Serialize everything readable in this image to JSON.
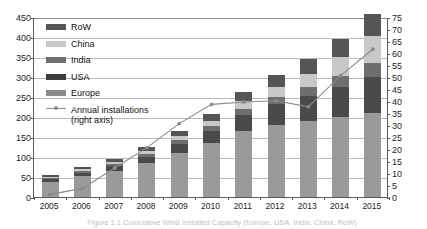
{
  "chart_data": {
    "type": "bar",
    "title": "",
    "xlabel": "",
    "ylabel": "",
    "categories": [
      "2005",
      "2006",
      "2007",
      "2008",
      "2009",
      "2010",
      "2011",
      "2012",
      "2013",
      "2014",
      "2015"
    ],
    "ylim": [
      0,
      450
    ],
    "y2lim": [
      0,
      75
    ],
    "yticks": [
      "450",
      "400",
      "350",
      "300",
      "250",
      "200",
      "150",
      "100",
      "50",
      "0"
    ],
    "y2ticks": [
      "75",
      "70",
      "65",
      "60",
      "55",
      "50",
      "45",
      "40",
      "35",
      "30",
      "25",
      "20",
      "15",
      "10",
      "5",
      "0"
    ],
    "grid": true,
    "legend_position": "upper-left-inside",
    "stack_order_bottom_to_top": [
      "Europe",
      "USA",
      "India",
      "China",
      "RoW"
    ],
    "series": [
      {
        "name": "Europe",
        "color": "#9a9a9a",
        "values": [
          38,
          52,
          66,
          84,
          110,
          135,
          165,
          180,
          190,
          200,
          210
        ]
      },
      {
        "name": "USA",
        "color": "#4a4a4a",
        "values": [
          6,
          8,
          11,
          16,
          22,
          30,
          40,
          52,
          62,
          75,
          90
        ]
      },
      {
        "name": "India",
        "color": "#6e6e6e",
        "values": [
          4,
          5,
          6,
          8,
          10,
          12,
          15,
          18,
          22,
          28,
          34
        ]
      },
      {
        "name": "China",
        "color": "#c8c8c8",
        "values": [
          3,
          4,
          5,
          7,
          10,
          14,
          20,
          26,
          34,
          48,
          68
        ]
      },
      {
        "name": "RoW",
        "color": "#555555",
        "values": [
          4,
          6,
          8,
          10,
          13,
          17,
          22,
          28,
          36,
          44,
          56
        ]
      }
    ],
    "line_series": {
      "name": "Annual installations (right axis)",
      "axis": "right",
      "color": "#8a8a8a",
      "marker": "circle",
      "values": [
        1.5,
        4.0,
        12.5,
        21.0,
        31.0,
        39.0,
        40.0,
        40.5,
        38.0,
        51.0,
        62.0
      ]
    }
  },
  "legend": {
    "items": [
      {
        "label": "RoW",
        "color": "#555555"
      },
      {
        "label": "China",
        "color": "#c8c8c8"
      },
      {
        "label": "India",
        "color": "#6e6e6e"
      },
      {
        "label": "USA",
        "color": "#3d3d3d"
      },
      {
        "label": "Europe",
        "color": "#8a8a8a"
      }
    ],
    "line_label_1": "Annual installations",
    "line_label_2": "(right axis)"
  },
  "caption": {
    "text": "Figure 1.1 Cumulative Wind Installed Capacity (Europe, USA, India, China, RoW)"
  }
}
